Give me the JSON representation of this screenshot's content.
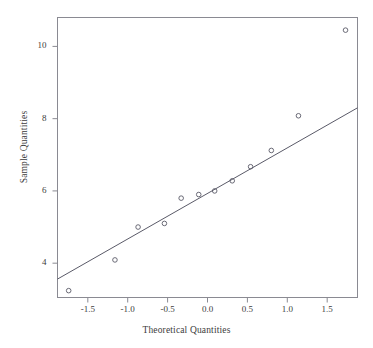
{
  "chart_data": {
    "type": "scatter",
    "title": "",
    "xlabel": "Theoretical Quantities",
    "ylabel": "Sample Quantities",
    "xlim": [
      -1.88,
      1.88
    ],
    "ylim": [
      3.05,
      10.8
    ],
    "grid": false,
    "legend": null,
    "xticks": [
      -1.5,
      -1.0,
      -0.5,
      0.0,
      0.5,
      1.0,
      1.5
    ],
    "xtick_labels": [
      "-1.5",
      "-1.0",
      "-0.5",
      "0.0",
      "0.5",
      "1.0",
      "1.5"
    ],
    "yticks": [
      4,
      6,
      8,
      10
    ],
    "ytick_labels": [
      "4",
      "6",
      "8",
      "10"
    ],
    "marker": "open-circle",
    "marker_color": "#5a5a68",
    "line_color": "#5a5a68",
    "frame_color": "#8a8a92",
    "points": [
      {
        "x": -1.74,
        "y": 3.24
      },
      {
        "x": -1.16,
        "y": 4.09
      },
      {
        "x": -0.87,
        "y": 5.0
      },
      {
        "x": -0.54,
        "y": 5.1
      },
      {
        "x": -0.33,
        "y": 5.8
      },
      {
        "x": -0.11,
        "y": 5.9
      },
      {
        "x": 0.09,
        "y": 6.0
      },
      {
        "x": 0.31,
        "y": 6.28
      },
      {
        "x": 0.54,
        "y": 6.67
      },
      {
        "x": 0.8,
        "y": 7.12
      },
      {
        "x": 1.14,
        "y": 8.08
      },
      {
        "x": 1.73,
        "y": 10.45
      }
    ],
    "reference_line": {
      "x_start": -1.88,
      "y_start": 3.56,
      "x_end": 1.88,
      "y_end": 8.3,
      "description": "qq reference line"
    }
  },
  "figure": {
    "x_axis_title": "Theoretical Quantities",
    "y_axis_title": "Sample Quantities"
  }
}
